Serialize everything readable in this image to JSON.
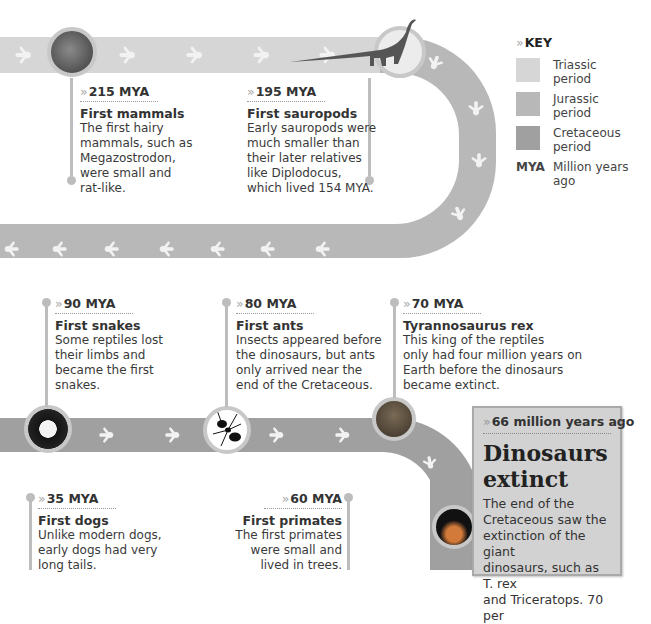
{
  "key": {
    "title": "KEY",
    "items": [
      {
        "label": "Triassic period",
        "line1": "Triassic",
        "line2": "period",
        "color": "#d6d6d6"
      },
      {
        "label": "Jurassic period",
        "line1": "Jurassic",
        "line2": "period",
        "color": "#b8b8b8"
      },
      {
        "label": "Cretaceous period",
        "line1": "Cretaceous",
        "line2": "period",
        "color": "#a0a0a0"
      }
    ],
    "abbr": "MYA",
    "abbr_line1": "Million years",
    "abbr_line2": "ago"
  },
  "colors": {
    "triassic": "#d6d6d6",
    "jurassic": "#b8b8b8",
    "cretaceous": "#a0a0a0",
    "stem": "#bdbdbd",
    "callout_bg": "#d2d2d2"
  },
  "events": [
    {
      "mya": "215 MYA",
      "title": "First mammals",
      "lines": [
        "The first hairy",
        "mammals, such as",
        "Megazostrodon,",
        "were small and",
        "rat-like."
      ]
    },
    {
      "mya": "195 MYA",
      "title": "First sauropods",
      "lines": [
        "Early sauropods were",
        "much smaller than",
        "their later relatives",
        "like Diplodocus,",
        "which lived 154 MYA."
      ]
    },
    {
      "mya": "90 MYA",
      "title": "First snakes",
      "lines": [
        "Some reptiles lost",
        "their limbs and",
        "became the first",
        "snakes."
      ]
    },
    {
      "mya": "80 MYA",
      "title": "First ants",
      "lines": [
        "Insects appeared before",
        "the dinosaurs, but ants",
        "only arrived near the",
        "end of the Cretaceous."
      ]
    },
    {
      "mya": "70 MYA",
      "title": "Tyrannosaurus rex",
      "lines": [
        "This king of the reptiles",
        "only had four million years on",
        "Earth before the dinosaurs",
        "became extinct."
      ]
    },
    {
      "mya": "35 MYA",
      "title": "First dogs",
      "lines": [
        "Unlike modern dogs,",
        "early dogs had very",
        "long tails."
      ]
    },
    {
      "mya": "60 MYA",
      "title": "First primates",
      "lines": [
        "The first primates",
        "were small and",
        "lived in trees."
      ]
    }
  ],
  "callout": {
    "subtitle": "66 million years ago",
    "heading_line1": "Dinosaurs",
    "heading_line2": "extinct",
    "lines": [
      "The end of the",
      "Cretaceous saw the",
      "extinction of the giant",
      "dinosaurs, such as T. rex",
      "and Triceratops. 70 per"
    ]
  },
  "chevron": "»"
}
